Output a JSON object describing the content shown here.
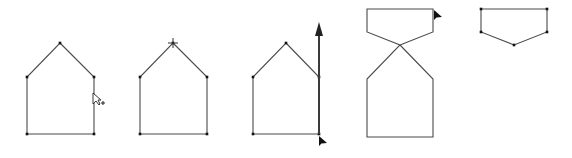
{
  "diagram": {
    "title": "",
    "colors": {
      "edge": "#4a4a4a",
      "vertex": "#111111",
      "arrow": "#222222",
      "background": "#ffffff"
    },
    "frames": [
      {
        "id": "house-1",
        "description": "Pentagon house shape with cursor near right wall",
        "vertices": [
          [
            60,
            43
          ],
          [
            94,
            77
          ],
          [
            94,
            134
          ],
          [
            27,
            134
          ],
          [
            27,
            77
          ]
        ],
        "cursor": {
          "type": "arrow-plus-icon",
          "position": [
            93,
            93
          ]
        }
      },
      {
        "id": "house-2",
        "description": "Pentagon house shape with apex selected (crosshair)",
        "vertices": [
          [
            173,
            43
          ],
          [
            207,
            77
          ],
          [
            207,
            134
          ],
          [
            140,
            134
          ],
          [
            140,
            77
          ]
        ],
        "marker": {
          "type": "crosshair-icon",
          "position": [
            173,
            43
          ]
        }
      },
      {
        "id": "house-3",
        "description": "Pentagon house shape with vertical drag arrow on right edge",
        "vertices": [
          [
            286,
            43
          ],
          [
            319,
            77
          ],
          [
            319,
            134
          ],
          [
            253,
            134
          ],
          [
            253,
            77
          ]
        ],
        "arrow": {
          "from": [
            319,
            134
          ],
          "to": [
            319,
            22
          ]
        },
        "cursor": {
          "type": "arrow-cursor-icon",
          "position": [
            319,
            136
          ]
        }
      },
      {
        "id": "house-4",
        "description": "Shape with bottom-right corner dragged to top creating crossed edges",
        "vertices": [
          [
            400,
            45
          ],
          [
            433,
            79
          ],
          [
            433,
            137
          ],
          [
            367,
            137
          ],
          [
            367,
            79
          ],
          [
            400,
            45
          ],
          [
            367,
            32
          ],
          [
            367,
            9
          ],
          [
            433,
            9
          ],
          [
            433,
            32
          ],
          [
            400,
            45
          ]
        ],
        "cursor": {
          "type": "arrow-cursor-icon",
          "position": [
            434,
            10
          ]
        }
      },
      {
        "id": "shape-5",
        "description": "Resulting inverted pentagon",
        "vertices": [
          [
            481,
            9
          ],
          [
            547,
            9
          ],
          [
            547,
            32
          ],
          [
            514,
            45
          ],
          [
            481,
            32
          ]
        ]
      }
    ]
  }
}
